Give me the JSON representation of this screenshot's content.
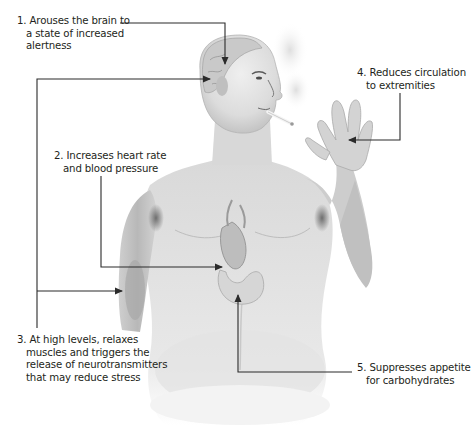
{
  "diagram": {
    "colors": {
      "background": "#ffffff",
      "text": "#231f20",
      "arrow": "#2b2b2b",
      "skin_light": "#e6e6e6",
      "skin_mid": "#c9c9c9",
      "skin_dark": "#8a8a8a"
    },
    "callouts": [
      {
        "number": "1.",
        "lines": [
          "Arouses the brain to",
          "a state of increased",
          "alertness"
        ],
        "target": "brain"
      },
      {
        "number": "2.",
        "lines": [
          "Increases heart rate",
          "and blood pressure"
        ],
        "target": "heart"
      },
      {
        "number": "3.",
        "lines": [
          "At high levels, relaxes",
          "muscles and triggers the",
          "release of neurotransmitters",
          "that may reduce stress"
        ],
        "target": "brain and arm muscle"
      },
      {
        "number": "4.",
        "lines": [
          "Reduces circulation",
          "to extremities"
        ],
        "target": "hand"
      },
      {
        "number": "5.",
        "lines": [
          "Suppresses appetite",
          "for carbohydrates"
        ],
        "target": "stomach"
      }
    ]
  }
}
